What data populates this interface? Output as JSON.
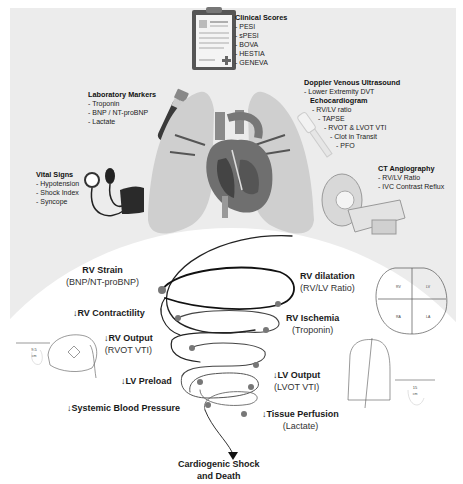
{
  "diagnostics": {
    "clinical_scores": {
      "title": "Clinical Scores",
      "items": [
        "- PESI",
        "- sPESI",
        "- BOVA",
        "- HESTIA",
        "- GENEVA"
      ]
    },
    "laboratory_markers": {
      "title": "Laboratory Markers",
      "items": [
        "- Troponin",
        "- BNP / NT-proBNP",
        "- Lactate"
      ]
    },
    "doppler": {
      "title": "Doppler Venous Ultrasound",
      "items": [
        "- Lower Extremity DVT"
      ]
    },
    "echocardiogram": {
      "title": "Echocardiogram",
      "items": [
        "- RV/LV ratio",
        "- TAPSE",
        "- RVOT & LVOT VTI",
        "- Clot in Transit",
        "- PFO"
      ]
    },
    "vital_signs": {
      "title": "Vital Signs",
      "items": [
        "- Hypotension",
        "- Shock Index",
        "- Syncope"
      ]
    },
    "ct_angiography": {
      "title": "CT Angiography",
      "items": [
        "- RV/LV Ratio",
        "- IVC Contrast Reflux"
      ]
    }
  },
  "spiral": {
    "steps": [
      {
        "title": "RV Strain",
        "sub": "(BNP/NT-proBNP)"
      },
      {
        "title": "RV dilatation",
        "sub": "(RV/LV Ratio)"
      },
      {
        "title": "↓RV Contractility",
        "sub": ""
      },
      {
        "title": "RV Ischemia",
        "sub": "(Troponin)"
      },
      {
        "title": "↓RV Output",
        "sub": "(RVOT VTI)"
      },
      {
        "title": "↓LV Preload",
        "sub": ""
      },
      {
        "title": "↓LV Output",
        "sub": "(LVOT VTI)"
      },
      {
        "title": "↓Systemic Blood Pressure",
        "sub": ""
      },
      {
        "title": "↓Tissue Perfusion",
        "sub": "(Lactate)"
      }
    ],
    "outcome": {
      "line1": "Cardiogenic Shock",
      "line2": "and Death"
    }
  },
  "echo_images": {
    "rvot_measure": {
      "value": "9.5",
      "unit": "cm"
    },
    "lvot_measure": {
      "value": "15",
      "unit": "cm"
    },
    "chamber_labels": [
      "RV",
      "LV",
      "RA",
      "LA"
    ]
  },
  "colors": {
    "panel_bg": "#ececec",
    "spiral_dark": "#1a1a1a",
    "dot": "#7a7a7a"
  }
}
